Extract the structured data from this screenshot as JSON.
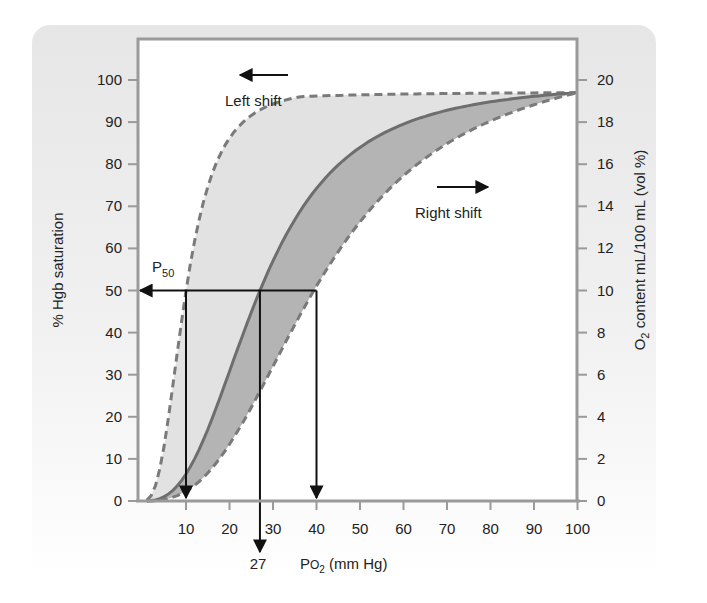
{
  "chart_data": {
    "type": "line",
    "title": "",
    "xlabel": "PO2 (mm Hg)",
    "xlabel_parts": {
      "main": "P",
      "o": "O",
      "sub": "2",
      "rest": " (mm Hg)"
    },
    "ylabel_left": "% Hgb saturation",
    "ylabel_right": "O2 content mL/100 mL (vol %)",
    "ylabel_right_parts": {
      "pre": "O",
      "sub": "2",
      "rest": " content mL/100 mL (vol %)"
    },
    "xlim": [
      0,
      100
    ],
    "ylim_left": [
      0,
      100
    ],
    "ylim_right": [
      0,
      20
    ],
    "x_ticks": [
      10,
      20,
      30,
      40,
      50,
      60,
      70,
      80,
      90,
      100
    ],
    "y_ticks_left": [
      0,
      10,
      20,
      30,
      40,
      50,
      60,
      70,
      80,
      90,
      100
    ],
    "y_ticks_right": [
      0,
      2,
      4,
      6,
      8,
      10,
      12,
      14,
      16,
      18,
      20
    ],
    "grid": false,
    "series": [
      {
        "name": "Left shift",
        "p50": 10,
        "style": "dashed",
        "color": "#7a7a7a"
      },
      {
        "name": "Normal",
        "p50": 27,
        "style": "solid",
        "color": "#6e6e6e"
      },
      {
        "name": "Right shift",
        "p50": 40,
        "style": "dashed",
        "color": "#7a7a7a"
      }
    ],
    "hill_n": 2.7,
    "saturation_max": 97,
    "annotations": {
      "left_shift": "Left shift",
      "right_shift": "Right shift",
      "p50_label": {
        "main": "P",
        "sub": "50"
      },
      "p50_level": 50,
      "p50_normal_label": "27"
    },
    "fills": {
      "left_band": "#e2e2e2",
      "right_band": "#b4b4b4"
    }
  },
  "panel": {
    "background_top": "#e6e6e6",
    "background_bottom": "#ffffff"
  }
}
